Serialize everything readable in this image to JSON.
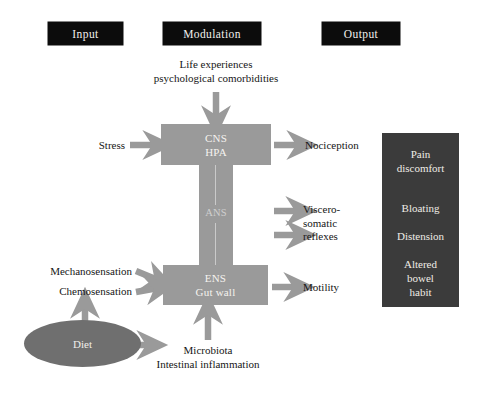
{
  "figure": {
    "background_color": "#ffffff",
    "gray_block_color": "#9a9a9a",
    "dark_panel_color": "#3b3b3b",
    "header_box_color": "#0c0c0c",
    "ellipse_color": "#6f6f6f",
    "arrow_color": "#9a9a9a",
    "text_color": "#161616"
  },
  "headers": {
    "input": "Input",
    "modulation": "Modulation",
    "output": "Output"
  },
  "modulation": {
    "top_note_line1": "Life experiences",
    "top_note_line2": "psychological comorbidities",
    "cns_line1": "CNS",
    "cns_line2": "HPA",
    "ans": "ANS",
    "ens_line1": "ENS",
    "ens_line2": "Gut wall",
    "bottom_note_line1": "Microbiota",
    "bottom_note_line2": "Intestinal inflammation"
  },
  "inputs": {
    "stress": "Stress",
    "mechanosensation": "Mechanosensation",
    "chemosensation": "Chemosensation",
    "diet": "Diet"
  },
  "outputs": {
    "nociception": "Nociception",
    "viscerosomatic_line1": "Viscero-",
    "viscerosomatic_line2": "somatic",
    "viscerosomatic_line3": "reflexes",
    "motility": "Motility"
  },
  "symptoms": {
    "pain_line1": "Pain",
    "pain_line2": "discomfort",
    "bloating": "Bloating",
    "distension": "Distension",
    "altered_line1": "Altered",
    "altered_line2": "bowel",
    "altered_line3": "habit"
  },
  "icons": {
    "arrow_down_to_cns": "arrow-down-icon",
    "arrow_right_stress": "arrow-right-icon",
    "arrow_right_nociception": "arrow-right-icon",
    "arrow_right_viscero_upper": "arrow-right-icon",
    "arrow_right_viscero_lower": "arrow-right-icon",
    "arrow_right_mechano": "arrow-right-icon",
    "arrow_right_chemo": "arrow-right-icon",
    "arrow_right_motility": "arrow-right-icon",
    "arrow_up_microbiota": "arrow-up-icon",
    "arrow_up_diet": "arrow-up-icon",
    "arrow_right_diet": "arrow-right-icon"
  }
}
